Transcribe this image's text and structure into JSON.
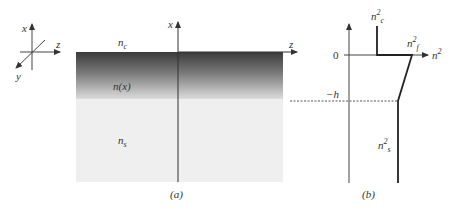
{
  "axes_triad": {
    "x_label": "x",
    "y_label": "y",
    "z_label": "z"
  },
  "panel_a": {
    "caption": "(a)",
    "axis_x_label": "x",
    "axis_z_label": "z",
    "region_cover": "n",
    "region_cover_sub": "c",
    "region_film": "n(x)",
    "region_substrate": "n",
    "region_substrate_sub": "s",
    "colors": {
      "film_top": "#3c3c3c",
      "film_bottom": "#d8d8d8",
      "substrate": "#efefef"
    }
  },
  "panel_b": {
    "caption": "(b)",
    "axis_h_label": "n",
    "axis_h_sup": "2",
    "tick_zero": "0",
    "tick_minus_h": "−h",
    "label_cover": "n",
    "label_cover_sup": "2",
    "label_cover_sub": "c",
    "label_film": "n",
    "label_film_sup": "2",
    "label_film_sub": "f",
    "label_substrate": "n",
    "label_substrate_sup": "2",
    "label_substrate_sub": "s"
  }
}
